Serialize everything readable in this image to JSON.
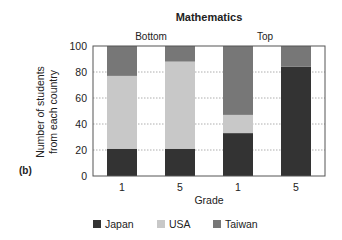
{
  "chart_data": {
    "type": "bar",
    "stacked": true,
    "panel_label": "(b)",
    "title": "Mathematics",
    "group_labels": [
      "Bottom",
      "Top"
    ],
    "categories": [
      "1",
      "5",
      "1",
      "5"
    ],
    "category_groups": [
      "Bottom",
      "Bottom",
      "Top",
      "Top"
    ],
    "xlabel": "Grade",
    "ylabel": [
      "Number of students",
      "from each country"
    ],
    "ylim": [
      0,
      100
    ],
    "yticks": [
      0,
      20,
      40,
      60,
      80,
      100
    ],
    "grid": true,
    "legend_position": "bottom",
    "series": [
      {
        "name": "Japan",
        "color": "#333333",
        "values": [
          21,
          21,
          33,
          84
        ]
      },
      {
        "name": "USA",
        "color": "#c8c8c8",
        "values": [
          56,
          67,
          14,
          0
        ]
      },
      {
        "name": "Taiwan",
        "color": "#777777",
        "values": [
          23,
          12,
          53,
          16
        ]
      }
    ]
  }
}
